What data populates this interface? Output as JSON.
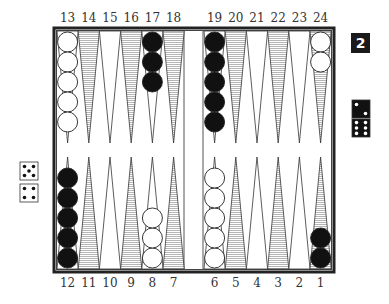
{
  "game": "Backgammon",
  "colors": {
    "white_checker": "#ffffff",
    "black_checker": "#111111",
    "shaded_point": "#b5b5b5",
    "board_border": "#222222"
  },
  "top_labels": [
    "13",
    "14",
    "15",
    "16",
    "17",
    "18",
    "19",
    "20",
    "21",
    "22",
    "23",
    "24"
  ],
  "bottom_labels": [
    "12",
    "11",
    "10",
    "9",
    "8",
    "7",
    "6",
    "5",
    "4",
    "3",
    "2",
    "1"
  ],
  "doubling_cube": {
    "value": "2"
  },
  "dice_black": [
    2,
    6
  ],
  "dice_white": [
    5,
    4
  ],
  "checkers": [
    {
      "point": 13,
      "color": "white",
      "count": 5
    },
    {
      "point": 17,
      "color": "black",
      "count": 3
    },
    {
      "point": 19,
      "color": "black",
      "count": 5
    },
    {
      "point": 24,
      "color": "white",
      "count": 2
    },
    {
      "point": 12,
      "color": "black",
      "count": 5
    },
    {
      "point": 8,
      "color": "white",
      "count": 3
    },
    {
      "point": 6,
      "color": "white",
      "count": 5
    },
    {
      "point": 1,
      "color": "black",
      "count": 2
    }
  ]
}
